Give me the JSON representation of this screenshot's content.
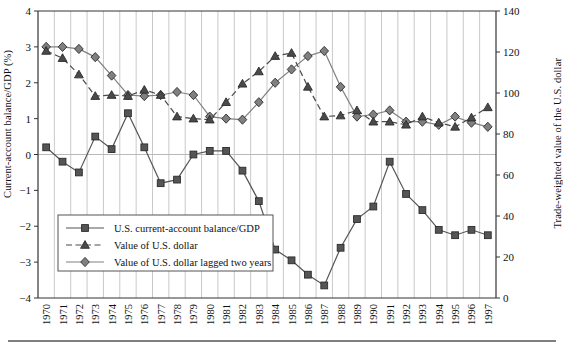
{
  "chart_data": {
    "type": "line",
    "title": "",
    "xlabel": "",
    "ylabel": "Current-account balance/GDP (%)",
    "ylabel_right": "Trade-weighted value of the U.S. dollar",
    "ylim": [
      -4,
      4
    ],
    "ylim_right": [
      0,
      140
    ],
    "yticks": [
      "4",
      "3",
      "2",
      "1",
      "0",
      "-1",
      "-2",
      "-3",
      "-4"
    ],
    "yticks_right": [
      "140",
      "120",
      "100",
      "80",
      "60",
      "40",
      "20",
      "0"
    ],
    "grid": "vertical",
    "legend_position": "lower-left-inside",
    "categories": [
      "1970",
      "1971",
      "1972",
      "1973",
      "1974",
      "1975",
      "1976",
      "1977",
      "1978",
      "1979",
      "1980",
      "1981",
      "1982",
      "1983",
      "1984",
      "1985",
      "1986",
      "1987",
      "1988",
      "1989",
      "1990",
      "1991",
      "1992",
      "1993",
      "1994",
      "1995",
      "1996",
      "1997"
    ],
    "series": [
      {
        "name": "U.S. current-account balance/GDP",
        "axis": "left",
        "marker": "square",
        "linestyle": "solid",
        "color": "#555555",
        "values": [
          0.2,
          -0.2,
          -0.5,
          0.5,
          0.15,
          1.15,
          0.2,
          -0.8,
          -0.7,
          0.0,
          0.1,
          0.1,
          -0.45,
          -1.3,
          -2.65,
          -2.95,
          -3.35,
          -3.65,
          -2.6,
          -1.8,
          -1.45,
          -0.2,
          -1.1,
          -1.55,
          -2.1,
          -2.25,
          -2.1,
          -2.25
        ]
      },
      {
        "name": "Value of U.S. dollar",
        "axis": "right",
        "marker": "triangle",
        "linestyle": "dashed",
        "color": "#4a4a4a",
        "values": [
          120.5,
          117.0,
          109.0,
          98.5,
          99.0,
          98.5,
          101.5,
          99.0,
          88.5,
          87.5,
          87.0,
          95.5,
          104.5,
          110.5,
          118.0,
          119.5,
          103.0,
          88.5,
          89.0,
          91.5,
          86.0,
          86.0,
          84.5,
          88.5,
          85.5,
          83.5,
          88.0,
          93.0
        ]
      },
      {
        "name": "Value of U.S. dollar lagged two years",
        "axis": "right",
        "marker": "diamond",
        "linestyle": "solid",
        "color": "#808080",
        "values": [
          122.5,
          122.5,
          121.5,
          117.5,
          108.5,
          99.0,
          98.5,
          99.0,
          100.5,
          99.0,
          88.5,
          87.5,
          87.0,
          95.5,
          105.0,
          111.5,
          118.0,
          120.5,
          103.0,
          88.5,
          89.5,
          91.5,
          86.0,
          86.0,
          84.5,
          88.5,
          85.5,
          83.5
        ]
      }
    ]
  },
  "legend": {
    "entries": [
      {
        "label": "U.S. current-account balance/GDP"
      },
      {
        "label": "Value of U.S. dollar"
      },
      {
        "label": "Value of U.S. dollar lagged two years"
      }
    ]
  }
}
